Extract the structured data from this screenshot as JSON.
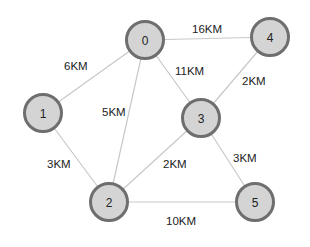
{
  "graph": {
    "nodes": [
      {
        "id": "0",
        "label": "0",
        "x": 145,
        "y": 40
      },
      {
        "id": "1",
        "label": "1",
        "x": 43,
        "y": 113
      },
      {
        "id": "2",
        "label": "2",
        "x": 109,
        "y": 202
      },
      {
        "id": "3",
        "label": "3",
        "x": 201,
        "y": 118
      },
      {
        "id": "4",
        "label": "4",
        "x": 270,
        "y": 37
      },
      {
        "id": "5",
        "label": "5",
        "x": 255,
        "y": 202
      }
    ],
    "edges": [
      {
        "from": "0",
        "to": "4",
        "label": "16KM",
        "lx": 192,
        "ly": 33
      },
      {
        "from": "0",
        "to": "1",
        "label": "6KM",
        "lx": 64,
        "ly": 70
      },
      {
        "from": "0",
        "to": "3",
        "label": "11KM",
        "lx": 175,
        "ly": 75
      },
      {
        "from": "0",
        "to": "2",
        "label": "5KM",
        "lx": 102,
        "ly": 116
      },
      {
        "from": "4",
        "to": "3",
        "label": "2KM",
        "lx": 242,
        "ly": 85
      },
      {
        "from": "1",
        "to": "2",
        "label": "3KM",
        "lx": 47,
        "ly": 168
      },
      {
        "from": "3",
        "to": "2",
        "label": "2KM",
        "lx": 163,
        "ly": 168
      },
      {
        "from": "3",
        "to": "5",
        "label": "3KM",
        "lx": 233,
        "ly": 162
      },
      {
        "from": "2",
        "to": "5",
        "label": "10KM",
        "lx": 166,
        "ly": 225
      }
    ]
  }
}
